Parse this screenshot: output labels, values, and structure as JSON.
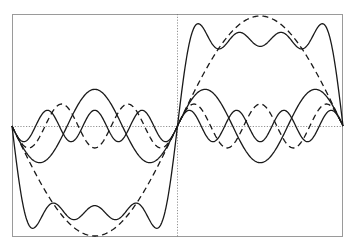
{
  "chart_data": {
    "type": "line",
    "title": "",
    "xlabel": "",
    "ylabel": "",
    "xlim": [
      -3.14159,
      3.14159
    ],
    "ylim": [
      -1.02,
      1.02
    ],
    "grid": false,
    "axes_lines": {
      "x_zero": true,
      "y_zero": true,
      "style": "dotted"
    },
    "legend": null,
    "series": [
      {
        "name": "sin(x)",
        "formula": "sin(1x)/1",
        "harmonic": 1,
        "amplitude": 1.0,
        "style": "dashed"
      },
      {
        "name": "sin(3x)/3",
        "formula": "sin(3x)/3",
        "harmonic": 3,
        "amplitude": 0.3333,
        "style": "solid"
      },
      {
        "name": "sin(5x)/5",
        "formula": "sin(5x)/5",
        "harmonic": 5,
        "amplitude": 0.2,
        "style": "dashed"
      },
      {
        "name": "sin(7x)/7",
        "formula": "sin(7x)/7",
        "harmonic": 7,
        "amplitude": 0.1429,
        "style": "solid"
      },
      {
        "name": "partial sum",
        "formula": "sin(x)+sin(3x)/3+sin(5x)/5+sin(7x)/7",
        "harmonics": [
          1,
          3,
          5,
          7
        ],
        "style": "solid"
      }
    ],
    "key_values": {
      "partial_sum_at_pi_over_2": 0.724,
      "partial_sum_max": 1.05,
      "fundamental_peak": 1.0
    }
  },
  "plot_area": {
    "left": 12,
    "top": 14,
    "right": 343,
    "bottom": 237,
    "zero_x": 177,
    "zero_y": 126,
    "unit_y_px": 110
  }
}
